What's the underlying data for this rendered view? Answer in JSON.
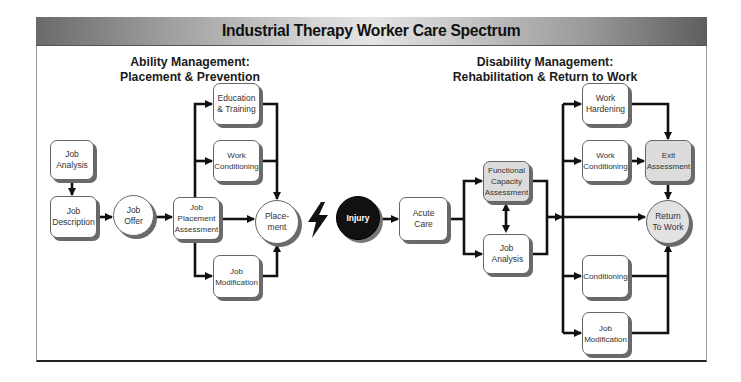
{
  "header": {
    "title": "Industrial Therapy Worker Care Spectrum"
  },
  "sections": {
    "left": {
      "line1": "Ability Management:",
      "line2": "Placement & Prevention"
    },
    "right": {
      "line1": "Disability Management:",
      "line2": "Rehabilitation & Return to Work"
    }
  },
  "nodes": {
    "job_analysis_left": "Job Analysis",
    "job_description": "Job Description",
    "job_offer": "Job Offer",
    "job_placement_assessment": "Job Placement Assessment",
    "education_training": "Education & Training",
    "work_conditioning_left": "Work Conditioning",
    "job_modification_left": "Job Modification",
    "placement": "Place- ment",
    "injury": "Injury",
    "acute_care": "Acute Care",
    "functional_capacity_assessment": "Functional Capacity Assessment",
    "job_analysis_right": "Job Analysis",
    "work_hardening": "Work Hardening",
    "work_conditioning_right": "Work Conditioning",
    "exit_assessment": "Exit Assessment",
    "return_to_work": "Return To Work",
    "conditioning": "Conditioning",
    "job_modification_right": "Job Modification"
  },
  "icons": {
    "event_separator": "lightning-bolt-icon"
  },
  "colors": {
    "line": "#111111",
    "shadow": "#6a6a6a",
    "gray_fill": "#dcdcdc",
    "injury_fill": "#111111"
  }
}
